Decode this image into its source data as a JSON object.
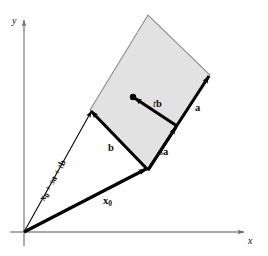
{
  "figure": {
    "kind": "vector-diagram",
    "background_color": "#ffffff"
  },
  "axes": {
    "x_label": "x",
    "y_label": "y",
    "axis_color": "#808080",
    "origin": {
      "x": 24,
      "y": 232
    }
  },
  "plane": {
    "fill_color": "#e2e2e2",
    "edge_color": "#8c8c8c",
    "corners": {
      "base": {
        "x": 148,
        "y": 170
      },
      "left": {
        "x": 90,
        "y": 110
      },
      "top": {
        "x": 148,
        "y": 15
      },
      "right": {
        "x": 210,
        "y": 75
      }
    }
  },
  "point": {
    "label": "",
    "marker": "filled-dot",
    "x": 133,
    "y": 97
  },
  "vectors": [
    {
      "id": "x0",
      "label_html": "x<sub>0</sub>",
      "label_text": "x0",
      "style": "thick",
      "color": "#000000",
      "from": {
        "x": 24,
        "y": 232
      },
      "to": {
        "x": 148,
        "y": 170
      },
      "label_pos": {
        "x": 104,
        "y": 198
      }
    },
    {
      "id": "x0-plus-sa-plus-tb",
      "label_text": "x0 + sa + tb",
      "style": "thin",
      "color": "#000000",
      "from": {
        "x": 24,
        "y": 232
      },
      "to": {
        "x": 90,
        "y": 110
      },
      "label_pos": {
        "x": 39,
        "y": 196
      },
      "rotation_deg": -61
    },
    {
      "id": "b",
      "label_text": "b",
      "style": "thick",
      "color": "#000000",
      "from": {
        "x": 148,
        "y": 170
      },
      "to": {
        "x": 90,
        "y": 110
      },
      "label_pos": {
        "x": 110,
        "y": 148
      }
    },
    {
      "id": "a",
      "label_text": "a",
      "style": "thick",
      "color": "#000000",
      "from": {
        "x": 148,
        "y": 170
      },
      "to": {
        "x": 210,
        "y": 75
      },
      "label_pos": {
        "x": 196,
        "y": 108
      }
    },
    {
      "id": "sa",
      "label_text": "sa",
      "style": "thick",
      "color": "#000000",
      "from": {
        "x": 148,
        "y": 170
      },
      "to": {
        "x": 177,
        "y": 126
      },
      "label_pos": {
        "x": 160,
        "y": 152
      }
    },
    {
      "id": "tb",
      "label_text": "tb",
      "style": "thick",
      "color": "#000000",
      "from": {
        "x": 177,
        "y": 126
      },
      "to": {
        "x": 133,
        "y": 97
      },
      "label_pos": {
        "x": 154,
        "y": 104
      }
    }
  ],
  "labels": {
    "x_axis": "x",
    "y_axis": "y",
    "x0": "x",
    "x0_sub": "0",
    "long_prefix": "x",
    "long_sub": "0",
    "long_mid": " + ",
    "long_s": "s",
    "long_a": "a",
    "long_plus": " + ",
    "long_t": "t",
    "long_b": "b",
    "vec_b": "b",
    "vec_a": "a",
    "scalar_s": "s",
    "scalar_t": "t",
    "sa_vec": "a",
    "tb_vec": "b"
  }
}
